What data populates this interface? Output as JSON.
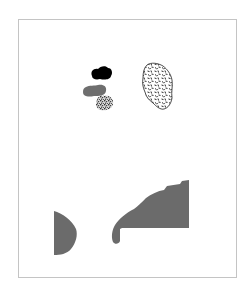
{
  "figure": {
    "frame_color": "#c4c4c4",
    "background": "#ffffff",
    "shapes": [
      {
        "id": "black-blob",
        "fill": "#000000",
        "pattern": "solid"
      },
      {
        "id": "gray-pill",
        "fill": "#6e6e6e",
        "pattern": "solid"
      },
      {
        "id": "small-speckled-blob",
        "fill": "#8a8a8a",
        "pattern": "dense-speckle"
      },
      {
        "id": "large-speckled-blob",
        "fill": "#ffffff",
        "stroke": "#222222",
        "pattern": "sparse-speckle"
      },
      {
        "id": "left-half-disc",
        "fill": "#6b6b6b",
        "pattern": "solid"
      },
      {
        "id": "right-large-region",
        "fill": "#6b6b6b",
        "pattern": "solid"
      }
    ]
  }
}
